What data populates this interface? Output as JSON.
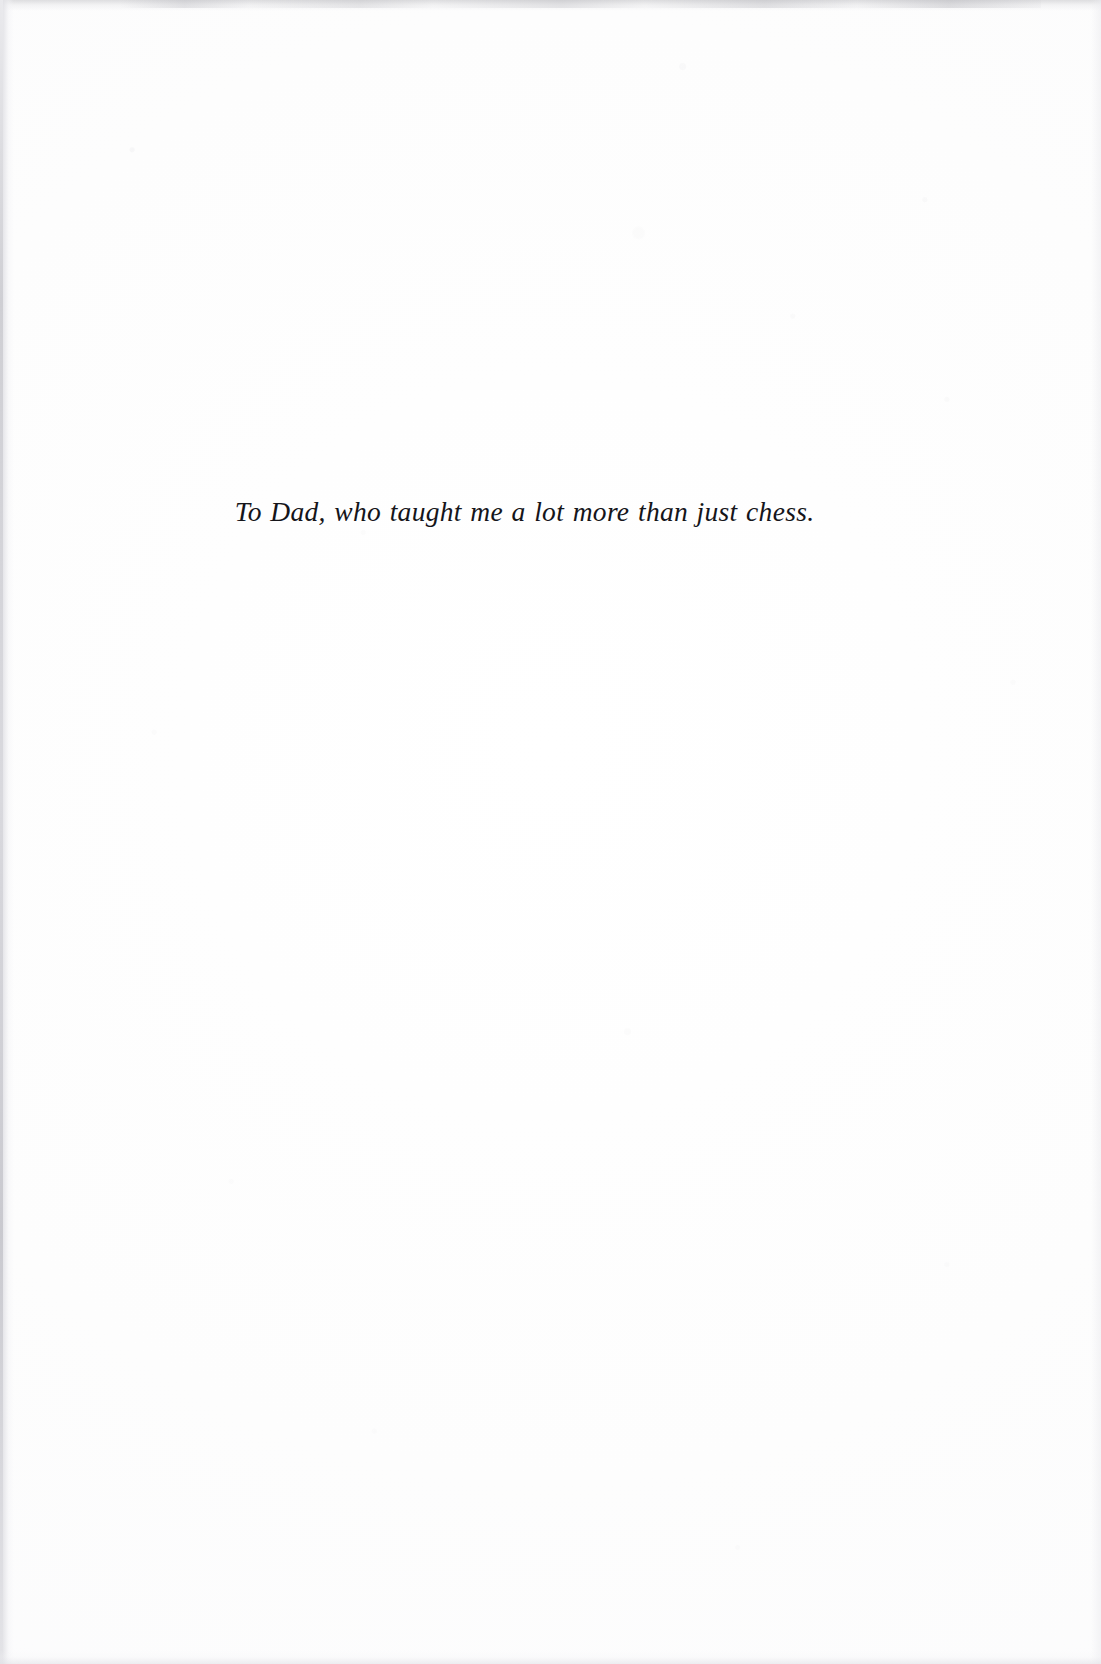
{
  "page": {
    "type": "book-dedication-page",
    "background_color": "#fdfdfd",
    "text_color": "#15151a",
    "width_px": 1101,
    "height_px": 1664
  },
  "dedication": {
    "text": "To Dad, who taught me a lot more than just chess.",
    "style": "italic-serif",
    "alignment": "center"
  },
  "artifacts": {
    "left_edge_band": "",
    "top_edge_band": "",
    "right_edge_band": "",
    "bottom_edge_band": "",
    "paper_noise": ""
  }
}
